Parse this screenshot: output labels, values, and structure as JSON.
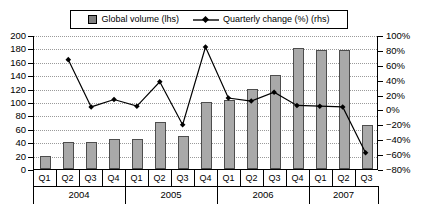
{
  "legend": {
    "series1_label": "Global volume (lhs)",
    "series1_marker": "square-marker-icon",
    "series2_label": "Quarterly change (%) (rhs)",
    "series2_marker": "diamond-line-marker-icon"
  },
  "axes": {
    "left_ticks": [
      "200",
      "180",
      "160",
      "140",
      "120",
      "100",
      "80",
      "60",
      "40",
      "20",
      "0"
    ],
    "right_ticks": [
      "100%",
      "80%",
      "60%",
      "40%",
      "20%",
      "0%",
      "−20%",
      "−40%",
      "−60%",
      "−80%"
    ],
    "left_min": 0,
    "left_max": 200,
    "right_min": -80,
    "right_max": 100
  },
  "xaxis": {
    "quarters": [
      "Q1",
      "Q2",
      "Q3",
      "Q4",
      "Q1",
      "Q2",
      "Q3",
      "Q4",
      "Q1",
      "Q2",
      "Q3",
      "Q4",
      "Q1",
      "Q2",
      "Q3"
    ],
    "years": [
      {
        "label": "2004",
        "span": 4
      },
      {
        "label": "2005",
        "span": 4
      },
      {
        "label": "2006",
        "span": 4
      },
      {
        "label": "2007",
        "span": 3
      }
    ]
  },
  "colors": {
    "bar_fill": "#a9a9a9",
    "bar_stroke": "#4d4d4d",
    "line": "#000000",
    "grid": "#9a9a9a",
    "axis": "#000000",
    "background": "#ffffff"
  },
  "chart_data": {
    "type": "bar",
    "title": "",
    "xlabel": "",
    "ylabel": "",
    "ylim": [
      0,
      200
    ],
    "y2lim": [
      -80,
      100
    ],
    "grid": true,
    "legend_position": "top",
    "categories": [
      "Q1 2004",
      "Q2 2004",
      "Q3 2004",
      "Q4 2004",
      "Q1 2005",
      "Q2 2005",
      "Q3 2005",
      "Q4 2005",
      "Q1 2006",
      "Q2 2006",
      "Q3 2006",
      "Q4 2006",
      "Q1 2007",
      "Q2 2007",
      "Q3 2007"
    ],
    "series": [
      {
        "name": "Global volume (lhs)",
        "type": "bar",
        "axis": "left",
        "values": [
          20,
          41,
          41,
          45,
          45,
          70,
          50,
          100,
          103,
          120,
          140,
          180,
          178,
          178,
          65
        ]
      },
      {
        "name": "Quarterly change (%) (rhs)",
        "type": "line",
        "axis": "right",
        "values": [
          null,
          68,
          4,
          14,
          5,
          38,
          -20,
          85,
          16,
          12,
          24,
          6,
          5,
          4,
          -58
        ]
      }
    ]
  }
}
